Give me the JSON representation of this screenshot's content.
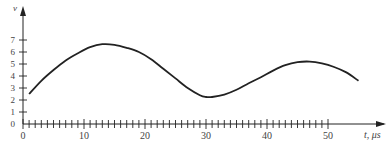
{
  "chart_data": {
    "type": "line",
    "title": "",
    "xlabel": "t, μs",
    "ylabel": "v",
    "xlim": [
      0,
      57
    ],
    "ylim": [
      0,
      8
    ],
    "x_ticks": [
      0,
      10,
      20,
      30,
      40,
      50
    ],
    "x_minor_tick_step": 1,
    "x_minor_tick_max": 50,
    "y_ticks": [
      0,
      1,
      2,
      3,
      4,
      5,
      6,
      7
    ],
    "grid": false,
    "legend": null,
    "series": [
      {
        "name": "v(t)",
        "x": [
          1,
          3,
          5,
          7,
          9,
          11,
          13,
          15,
          17,
          19,
          21,
          23,
          25,
          27,
          29,
          30,
          31,
          33,
          35,
          37,
          39,
          41,
          43,
          45,
          47,
          49,
          51,
          53,
          55
        ],
        "y": [
          2.5,
          3.6,
          4.5,
          5.3,
          5.9,
          6.4,
          6.65,
          6.6,
          6.35,
          6.0,
          5.4,
          4.6,
          3.8,
          3.0,
          2.4,
          2.25,
          2.25,
          2.45,
          2.85,
          3.4,
          3.9,
          4.45,
          4.9,
          5.15,
          5.2,
          5.05,
          4.75,
          4.3,
          3.6
        ]
      }
    ]
  },
  "axis": {
    "x_label": "t, μs",
    "y_label": "v",
    "x_tick_labels": [
      "0",
      "10",
      "20",
      "30",
      "40",
      "50"
    ],
    "y_tick_labels": [
      "0",
      "1",
      "2",
      "3",
      "4",
      "5",
      "6",
      "7"
    ]
  }
}
